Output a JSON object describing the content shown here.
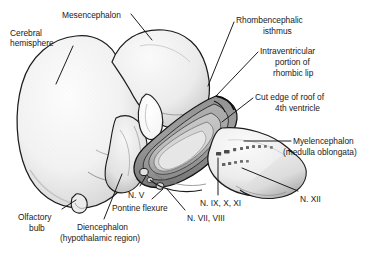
{
  "figure": {
    "background_color": "#ffffff",
    "ink_color": "#1a1a1a",
    "leader_color": "#111111"
  },
  "labels": [
    {
      "id": "mesencephalon",
      "text": "Mesencephalon",
      "x": 62,
      "y": 10,
      "align": "left"
    },
    {
      "id": "cerebral-hemisphere-1",
      "text": "Cerebral",
      "x": 10,
      "y": 28,
      "align": "left"
    },
    {
      "id": "cerebral-hemisphere-2",
      "text": "hemisphere",
      "x": 10,
      "y": 38,
      "align": "left"
    },
    {
      "id": "rhombencephalic-1",
      "text": "Rhombencephalic",
      "x": 236,
      "y": 15,
      "align": "left"
    },
    {
      "id": "rhombencephalic-2",
      "text": "isthmus",
      "x": 263,
      "y": 26,
      "align": "left"
    },
    {
      "id": "intraventricular-1",
      "text": "Intraventricular",
      "x": 260,
      "y": 46,
      "align": "left"
    },
    {
      "id": "intraventricular-2",
      "text": "portion of",
      "x": 275,
      "y": 57,
      "align": "left"
    },
    {
      "id": "intraventricular-3",
      "text": "rhombic lip",
      "x": 273,
      "y": 68,
      "align": "left"
    },
    {
      "id": "cut-edge-1",
      "text": "Cut edge of roof of",
      "x": 255,
      "y": 92,
      "align": "left"
    },
    {
      "id": "cut-edge-2",
      "text": "4th ventricle",
      "x": 275,
      "y": 103,
      "align": "left"
    },
    {
      "id": "myelencephalon-1",
      "text": "Myelencephalon",
      "x": 293,
      "y": 136,
      "align": "left"
    },
    {
      "id": "myelencephalon-2",
      "text": "(medulla oblongata)",
      "x": 283,
      "y": 147,
      "align": "left"
    },
    {
      "id": "nerve-v",
      "text": "N. V",
      "x": 128,
      "y": 190,
      "align": "left"
    },
    {
      "id": "pontine-flexure",
      "text": "Pontine flexure",
      "x": 112,
      "y": 203,
      "align": "left"
    },
    {
      "id": "nerve-ix-x-xi",
      "text": "N. IX, X, XI",
      "x": 200,
      "y": 198,
      "align": "left"
    },
    {
      "id": "nerve-vii-viii",
      "text": "N. VII, VIII",
      "x": 187,
      "y": 213,
      "align": "left"
    },
    {
      "id": "nerve-xii",
      "text": "N. XII",
      "x": 300,
      "y": 194,
      "align": "left"
    },
    {
      "id": "olfactory-bulb-1",
      "text": "Olfactory",
      "x": 18,
      "y": 212,
      "align": "left"
    },
    {
      "id": "olfactory-bulb-2",
      "text": "bulb",
      "x": 29,
      "y": 223,
      "align": "left"
    },
    {
      "id": "diencephalon-1",
      "text": "Diencephalon",
      "x": 77,
      "y": 222,
      "align": "left"
    },
    {
      "id": "diencephalon-2",
      "text": "(hypothalamic region)",
      "x": 60,
      "y": 233,
      "align": "left"
    }
  ],
  "structures": [
    {
      "id": "cerebral-hemisphere",
      "name": "Cerebral hemisphere"
    },
    {
      "id": "mesencephalon",
      "name": "Mesencephalon"
    },
    {
      "id": "diencephalon",
      "name": "Diencephalon (hypothalamic region)"
    },
    {
      "id": "olfactory-bulb",
      "name": "Olfactory bulb"
    },
    {
      "id": "rhombic-lip",
      "name": "Intraventricular portion of rhombic lip"
    },
    {
      "id": "fourth-ventricle",
      "name": "Roof of 4th ventricle (cut edge)"
    },
    {
      "id": "myelencephalon",
      "name": "Myelencephalon (medulla oblongata)"
    },
    {
      "id": "pontine-flexure",
      "name": "Pontine flexure"
    },
    {
      "id": "rhombencephalic-isthmus",
      "name": "Rhombencephalic isthmus"
    }
  ],
  "cranial_nerves": [
    "N. V",
    "N. VII, VIII",
    "N. IX, X, XI",
    "N. XII"
  ]
}
